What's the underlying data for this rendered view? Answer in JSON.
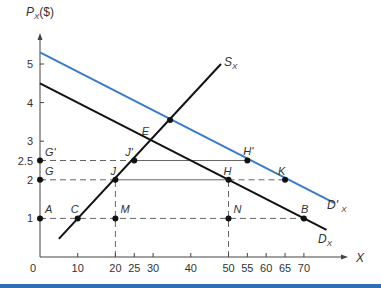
{
  "chart_data": {
    "type": "line",
    "title": "",
    "ylabel": "P",
    "ylabel_sub": "X",
    "ylabel_unit": "($)",
    "xlabel": "X",
    "xlim": [
      0,
      80
    ],
    "ylim": [
      0,
      6
    ],
    "grid": false,
    "x_ticks": [
      {
        "v": 10,
        "label": "10"
      },
      {
        "v": 20,
        "label": "20"
      },
      {
        "v": 25,
        "label": "25"
      },
      {
        "v": 30,
        "label": "30"
      },
      {
        "v": 40,
        "label": "40"
      },
      {
        "v": 50,
        "label": "50"
      },
      {
        "v": 55,
        "label": "55"
      },
      {
        "v": 60,
        "label": "60"
      },
      {
        "v": 65,
        "label": "65"
      },
      {
        "v": 70,
        "label": "70"
      }
    ],
    "origin_label": "0",
    "y_ticks": [
      {
        "v": 1,
        "label": "1"
      },
      {
        "v": 2,
        "label": "2"
      },
      {
        "v": 2.5,
        "label": "2.5"
      },
      {
        "v": 3,
        "label": "3"
      },
      {
        "v": 4,
        "label": "4"
      },
      {
        "v": 5,
        "label": "5"
      }
    ],
    "series": [
      {
        "name": "D_X",
        "label": "D",
        "sub": "X",
        "color": "#111111",
        "points": [
          [
            0,
            4.5
          ],
          [
            76,
            0.7
          ]
        ]
      },
      {
        "name": "D'_X",
        "label": "D' ",
        "sub": "X",
        "color": "#3a7cc7",
        "points": [
          [
            0,
            5.3
          ],
          [
            78,
            1.4
          ]
        ]
      },
      {
        "name": "S_X",
        "label": "S",
        "sub": "X",
        "color": "#111111",
        "points": [
          [
            5,
            0.47
          ],
          [
            48,
            5.0
          ]
        ]
      }
    ],
    "points": [
      {
        "name": "A",
        "x": 0,
        "y": 1
      },
      {
        "name": "C",
        "x": 10,
        "y": 1
      },
      {
        "name": "M",
        "x": 20,
        "y": 1
      },
      {
        "name": "N",
        "x": 50,
        "y": 1
      },
      {
        "name": "B",
        "x": 70,
        "y": 1
      },
      {
        "name": "G",
        "x": 0,
        "y": 2
      },
      {
        "name": "J",
        "x": 20,
        "y": 2
      },
      {
        "name": "H",
        "x": 50,
        "y": 2
      },
      {
        "name": "K",
        "x": 65,
        "y": 2
      },
      {
        "name": "G'",
        "x": 0,
        "y": 2.5
      },
      {
        "name": "J'",
        "x": 25,
        "y": 2.5
      },
      {
        "name": "H'",
        "x": 55,
        "y": 2.5
      },
      {
        "name": "E",
        "x": 28.6,
        "y": 3.0,
        "dot": false
      },
      {
        "name": "",
        "x": 34.5,
        "y": 3.55
      }
    ],
    "guide_lines": [
      {
        "from": [
          0,
          1
        ],
        "to": [
          70,
          1
        ],
        "style": "dashed"
      },
      {
        "from": [
          0,
          2
        ],
        "to": [
          20,
          2
        ],
        "style": "dashed"
      },
      {
        "from": [
          20,
          2
        ],
        "to": [
          50,
          2
        ],
        "style": "solid"
      },
      {
        "from": [
          50,
          2
        ],
        "to": [
          65,
          2
        ],
        "style": "dashed"
      },
      {
        "from": [
          0,
          2.5
        ],
        "to": [
          25,
          2.5
        ],
        "style": "dashed"
      },
      {
        "from": [
          25,
          2.5
        ],
        "to": [
          55,
          2.5
        ],
        "style": "solid"
      },
      {
        "from": [
          20,
          0
        ],
        "to": [
          20,
          2
        ],
        "style": "dashed"
      },
      {
        "from": [
          50,
          0
        ],
        "to": [
          50,
          2
        ],
        "style": "dashed"
      }
    ]
  }
}
